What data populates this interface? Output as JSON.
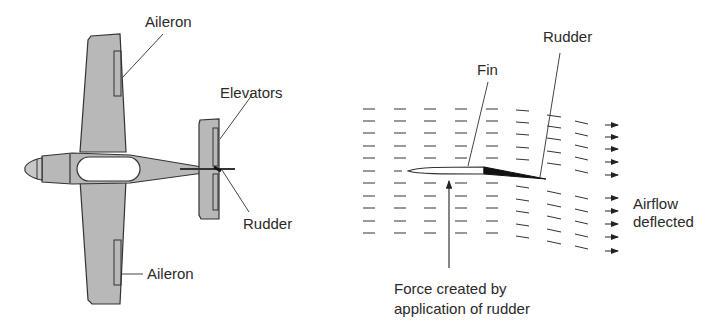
{
  "left_figure": {
    "labels": {
      "aileron_top": "Aileron",
      "elevators": "Elevators",
      "rudder": "Rudder",
      "aileron_bottom": "Aileron"
    }
  },
  "right_figure": {
    "labels": {
      "rudder": "Rudder",
      "fin": "Fin",
      "airflow_line1": "Airflow",
      "airflow_line2": "deflected",
      "force_line1": "Force created by",
      "force_line2": "application of rudder"
    }
  },
  "colors": {
    "aircraft_fill": "#b8b8b8",
    "outline": "#333333",
    "text": "#2a2a2a",
    "background": "#ffffff"
  }
}
